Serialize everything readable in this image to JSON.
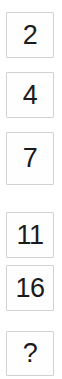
{
  "panel": {
    "name": "number-sequence-column",
    "background_color": "#ffffff",
    "cell_border_color": "#d2d2d2",
    "cell_fill_color": "#fefefe",
    "text_color": "#1b1b1b"
  },
  "sequence": {
    "cells": [
      {
        "value": "2",
        "is_unknown": false
      },
      {
        "value": "4",
        "is_unknown": false
      },
      {
        "value": "7",
        "is_unknown": false
      },
      {
        "value": "11",
        "is_unknown": false
      },
      {
        "value": "16",
        "is_unknown": false
      },
      {
        "value": "?",
        "is_unknown": true
      }
    ]
  }
}
